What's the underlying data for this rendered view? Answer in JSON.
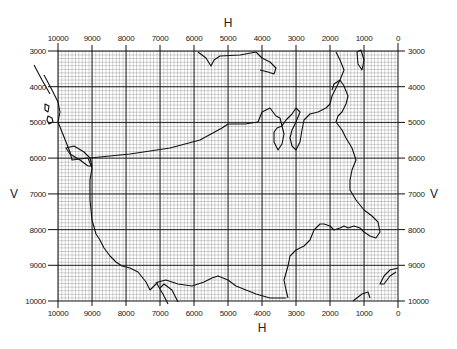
{
  "map": {
    "title_top": "H",
    "title_bottom": "H",
    "title_left": "V",
    "title_right": "V",
    "h_ticks": [
      "10000",
      "9000",
      "8000",
      "7000",
      "6000",
      "5000",
      "4000",
      "3000",
      "2000",
      "1000",
      "0"
    ],
    "v_ticks": [
      "3000",
      "4000",
      "5000",
      "6000",
      "7000",
      "8000",
      "9000",
      "10000"
    ],
    "h_range": [
      10000,
      0
    ],
    "v_range": [
      3000,
      10000
    ],
    "grid": {
      "major_step": 1000,
      "minor_divisions": 10
    },
    "features": [
      "us-coastline-outline",
      "us-canada-border",
      "great-lakes",
      "gulf-coast",
      "florida-peninsula"
    ],
    "colors": {
      "grid_minor": "#6a6a6a",
      "grid_major": "#111111",
      "outline": "#111111",
      "background": "#ffffff"
    }
  }
}
